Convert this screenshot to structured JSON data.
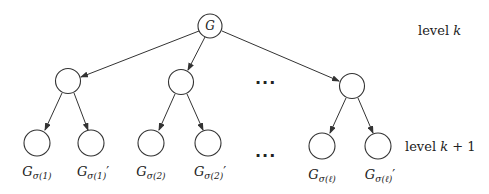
{
  "diagram": {
    "type": "tree",
    "root": {
      "label": "G",
      "x": 210,
      "y": 26
    },
    "middle_nodes": [
      {
        "x": 68,
        "y": 81
      },
      {
        "x": 181,
        "y": 82
      },
      {
        "x": 352,
        "y": 86
      }
    ],
    "leaves": [
      {
        "x": 37,
        "y": 143,
        "base": "G",
        "sub": "σ(1)",
        "prime": ""
      },
      {
        "x": 91,
        "y": 143,
        "base": "G",
        "sub": "σ(1)",
        "prime": "′"
      },
      {
        "x": 151,
        "y": 143,
        "base": "G",
        "sub": "σ(2)",
        "prime": ""
      },
      {
        "x": 208,
        "y": 143,
        "base": "G",
        "sub": "σ(2)",
        "prime": "′"
      },
      {
        "x": 322,
        "y": 146,
        "base": "G",
        "sub": "σ(ℓ)",
        "prime": ""
      },
      {
        "x": 378,
        "y": 146,
        "base": "G",
        "sub": "σ(ℓ)",
        "prime": "′"
      }
    ],
    "ellipsis_top": "···",
    "ellipsis_bottom": "···",
    "level_top": {
      "text": "level ",
      "var": "k"
    },
    "level_bottom": {
      "text": "level ",
      "var": "k",
      "suffix": " + 1"
    }
  }
}
